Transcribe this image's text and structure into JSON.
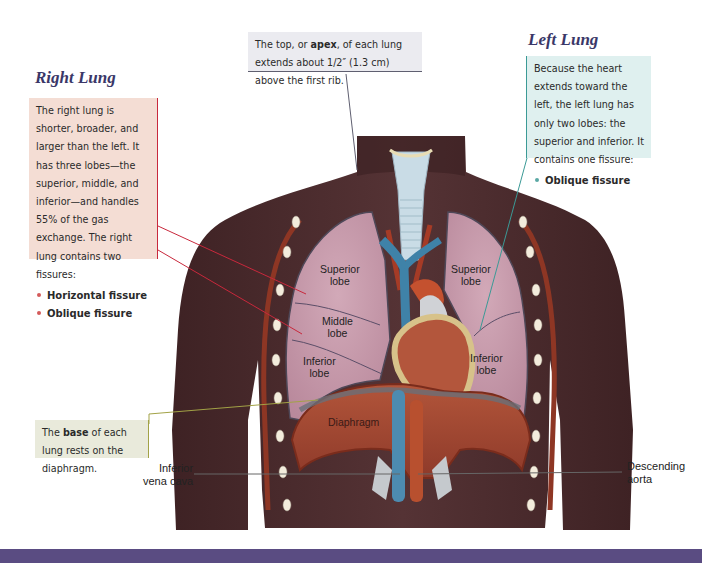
{
  "headings": {
    "right_lung": "Right Lung",
    "left_lung": "Left Lung"
  },
  "callouts": {
    "right_lung": {
      "text": "The right lung is shorter, broader, and larger than the left. It has three lobes—the superior, middle, and inferior—and handles 55% of the gas exchange. The right lung contains two fissures:",
      "fissures": [
        "Horizontal fissure",
        "Oblique fissure"
      ]
    },
    "left_lung": {
      "text": "Because the heart extends toward the left, the left lung has only two lobes: the superior and inferior. It contains one fissure:",
      "fissures": [
        "Oblique fissure"
      ]
    },
    "apex": {
      "pre": "The top, or ",
      "bold": "apex",
      "post": ", of each lung extends about 1/2″ (1.3 cm) above the first rib."
    },
    "base": {
      "pre": "The ",
      "bold": "base",
      "post": " of each lung rests on the diaphragm."
    }
  },
  "labels": {
    "right_superior": [
      "Superior",
      "lobe"
    ],
    "right_middle": [
      "Middle",
      "lobe"
    ],
    "right_inferior": [
      "Inferior",
      "lobe"
    ],
    "left_superior": [
      "Superior",
      "lobe"
    ],
    "left_inferior": [
      "Inferior",
      "lobe"
    ],
    "diaphragm": "Diaphragm",
    "inferior_vena_cava": [
      "Inferior",
      "vena cava"
    ],
    "descending_aorta": [
      "Descending",
      "aorta"
    ]
  },
  "colors": {
    "skin": "#4a2a2c",
    "lung": "#c79aac",
    "heading": "#3a3768",
    "right_accent": "#c8283c",
    "left_accent": "#3b9a96",
    "base_accent": "#a2a246",
    "apex_accent": "#5f5f70",
    "bottom_bar": "#5a4c82"
  }
}
